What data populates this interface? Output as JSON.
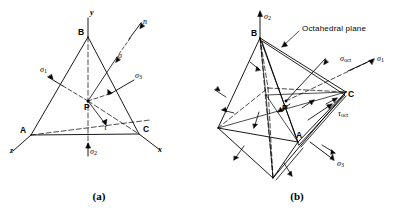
{
  "figure": {
    "background_color": "#ffffff",
    "stroke_color": "#000000",
    "panels": [
      {
        "id": "a",
        "caption": "(a)",
        "title": "Tetrahedron with stress components on an oblique plane",
        "vertices": [
          {
            "name": "B",
            "label": "B"
          },
          {
            "name": "A",
            "label": "A"
          },
          {
            "name": "C",
            "label": "C"
          },
          {
            "name": "P",
            "label": "P"
          }
        ],
        "axes": [
          {
            "name": "y-axis",
            "label": "y"
          },
          {
            "name": "x-axis",
            "label": "x"
          },
          {
            "name": "z-axis",
            "label": "z"
          }
        ],
        "vectors": [
          {
            "name": "normal-vector",
            "label": "n"
          },
          {
            "name": "sigma-vector",
            "label": "σ"
          },
          {
            "name": "tau-vector",
            "label": "τ"
          },
          {
            "name": "sigma-1",
            "label": "σ",
            "sub": "1"
          },
          {
            "name": "sigma-2",
            "label": "σ",
            "sub": "2"
          },
          {
            "name": "sigma-3",
            "label": "σ",
            "sub": "3"
          }
        ]
      },
      {
        "id": "b",
        "caption": "(b)",
        "title": "Octahedron showing the octahedral plane and octahedral stresses",
        "annotation": "Octahedral plane",
        "vertices": [
          {
            "name": "B",
            "label": "B"
          },
          {
            "name": "C",
            "label": "C"
          },
          {
            "name": "A",
            "label": "A"
          },
          {
            "name": "P",
            "label": "P"
          }
        ],
        "vectors": [
          {
            "name": "sigma-2",
            "label": "σ",
            "sub": "2"
          },
          {
            "name": "sigma-1",
            "label": "σ",
            "sub": "1"
          },
          {
            "name": "sigma-3",
            "label": "σ",
            "sub": "3"
          },
          {
            "name": "sigma-oct",
            "label": "σ",
            "sub": "oct"
          },
          {
            "name": "tau-oct",
            "label": "τ",
            "sub": "oct"
          }
        ]
      }
    ]
  }
}
